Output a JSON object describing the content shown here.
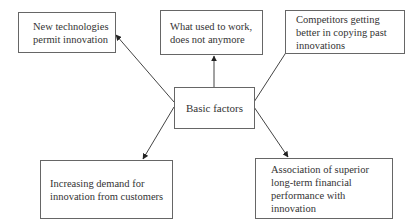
{
  "diagram": {
    "center": {
      "label": "Basic factors"
    },
    "factors": [
      {
        "id": "top-left",
        "label": "New technologies\npermit innovation"
      },
      {
        "id": "top",
        "label": "What used to work,\ndoes not anymore"
      },
      {
        "id": "top-right",
        "label": "Competitors getting\nbetter in copying past\ninnovations"
      },
      {
        "id": "bottom-left",
        "label": "Increasing demand for\ninnovation from customers"
      },
      {
        "id": "bottom-right",
        "label": "Association of superior\nlong-term financial\nperformance with\ninnovation"
      }
    ],
    "arrows": [
      {
        "from": "Basic factors",
        "to": "New technologies permit innovation"
      },
      {
        "from": "Basic factors",
        "to": "What used to work, does not anymore"
      },
      {
        "from": "Basic factors",
        "to": "Competitors getting better in copying past innovations"
      },
      {
        "from": "Basic factors",
        "to": "Increasing demand for innovation from customers"
      },
      {
        "from": "Basic factors",
        "to": "Association of superior long-term financial performance with innovation"
      }
    ],
    "colors": {
      "line": "#444444",
      "border": "#666666",
      "text": "#333333"
    }
  }
}
